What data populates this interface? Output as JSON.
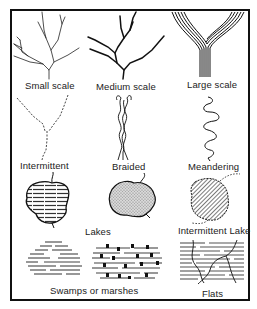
{
  "figure": {
    "title": "",
    "colors": {
      "ink": "#111111",
      "paper": "#ffffff",
      "fill_gray": "#c8c8c8"
    }
  },
  "panels": [
    {
      "id": "small-scale",
      "label": "Small scale",
      "symbol": "thin dendritic stream lines"
    },
    {
      "id": "medium-scale",
      "label": "Medium scale",
      "symbol": "medium-weight dendritic stream lines"
    },
    {
      "id": "large-scale",
      "label": "Large scale",
      "symbol": "multi-line double-banked river fork"
    },
    {
      "id": "intermittent",
      "label": "Intermittent",
      "symbol": "dashed-dotted stream lines"
    },
    {
      "id": "braided",
      "label": "Braided",
      "symbol": "interlaced channel strands"
    },
    {
      "id": "meandering",
      "label": "Meandering",
      "symbol": "sinuous single channel"
    },
    {
      "id": "lakes",
      "label": "Lakes",
      "symbol": "lake outlines with line fill and stipple fill"
    },
    {
      "id": "intermittent-lake",
      "label": "Intermittent Lake",
      "symbol": "hatched lake with dashed outline"
    },
    {
      "id": "swamps",
      "label": "Swamps or marshes",
      "symbol": "horizontal dash patterns with marsh tufts"
    },
    {
      "id": "flats",
      "label": "Flats",
      "symbol": "dashed horizontal lines crossed by channels"
    }
  ]
}
